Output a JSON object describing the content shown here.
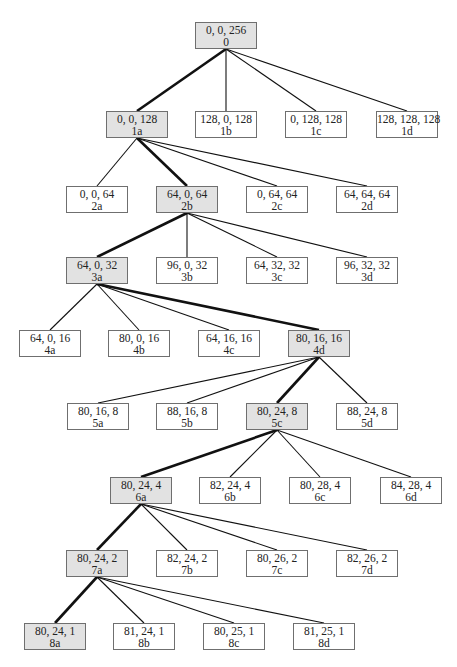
{
  "diagram": {
    "type": "search-tree",
    "colors": {
      "highlight_fill": "#e2e2e2",
      "node_fill": "#ffffff",
      "border": "#6f6f6f",
      "edge": "#111111"
    },
    "nodes": [
      {
        "id": "0",
        "coords": "0, 0, 256",
        "label": "0",
        "x": 195,
        "y": 22,
        "hl": true,
        "parent": null
      },
      {
        "id": "1a",
        "coords": "0, 0, 128",
        "label": "1a",
        "x": 106,
        "y": 111,
        "hl": true,
        "parent": "0"
      },
      {
        "id": "1b",
        "coords": "128, 0, 128",
        "label": "1b",
        "x": 195,
        "y": 111,
        "hl": false,
        "parent": "0"
      },
      {
        "id": "1c",
        "coords": "0, 128, 128",
        "label": "1c",
        "x": 285,
        "y": 111,
        "hl": false,
        "parent": "0"
      },
      {
        "id": "1d",
        "coords": "128, 128, 128",
        "label": "1d",
        "x": 376,
        "y": 111,
        "hl": false,
        "parent": "0"
      },
      {
        "id": "2a",
        "coords": "0, 0, 64",
        "label": "2a",
        "x": 66,
        "y": 186,
        "hl": false,
        "parent": "1a"
      },
      {
        "id": "2b",
        "coords": "64, 0, 64",
        "label": "2b",
        "x": 156,
        "y": 186,
        "hl": true,
        "parent": "1a"
      },
      {
        "id": "2c",
        "coords": "0, 64, 64",
        "label": "2c",
        "x": 246,
        "y": 186,
        "hl": false,
        "parent": "1a"
      },
      {
        "id": "2d",
        "coords": "64, 64, 64",
        "label": "2d",
        "x": 336,
        "y": 186,
        "hl": false,
        "parent": "1a"
      },
      {
        "id": "3a",
        "coords": "64, 0, 32",
        "label": "3a",
        "x": 66,
        "y": 257,
        "hl": true,
        "parent": "2b"
      },
      {
        "id": "3b",
        "coords": "96, 0, 32",
        "label": "3b",
        "x": 156,
        "y": 257,
        "hl": false,
        "parent": "2b"
      },
      {
        "id": "3c",
        "coords": "64, 32, 32",
        "label": "3c",
        "x": 246,
        "y": 257,
        "hl": false,
        "parent": "2b"
      },
      {
        "id": "3d",
        "coords": "96, 32, 32",
        "label": "3d",
        "x": 336,
        "y": 257,
        "hl": false,
        "parent": "2b"
      },
      {
        "id": "4a",
        "coords": "64, 0, 16",
        "label": "4a",
        "x": 19,
        "y": 330,
        "hl": false,
        "parent": "3a"
      },
      {
        "id": "4b",
        "coords": "80, 0, 16",
        "label": "4b",
        "x": 108,
        "y": 330,
        "hl": false,
        "parent": "3a"
      },
      {
        "id": "4c",
        "coords": "64, 16, 16",
        "label": "4c",
        "x": 198,
        "y": 330,
        "hl": false,
        "parent": "3a"
      },
      {
        "id": "4d",
        "coords": "80, 16, 16",
        "label": "4d",
        "x": 288,
        "y": 330,
        "hl": true,
        "parent": "3a"
      },
      {
        "id": "5a",
        "coords": "80, 16, 8",
        "label": "5a",
        "x": 67,
        "y": 403,
        "hl": false,
        "parent": "4d"
      },
      {
        "id": "5b",
        "coords": "88, 16, 8",
        "label": "5b",
        "x": 156,
        "y": 403,
        "hl": false,
        "parent": "4d"
      },
      {
        "id": "5c",
        "coords": "80, 24, 8",
        "label": "5c",
        "x": 246,
        "y": 403,
        "hl": true,
        "parent": "4d"
      },
      {
        "id": "5d",
        "coords": "88, 24, 8",
        "label": "5d",
        "x": 336,
        "y": 403,
        "hl": false,
        "parent": "4d"
      },
      {
        "id": "6a",
        "coords": "80, 24, 4",
        "label": "6a",
        "x": 110,
        "y": 477,
        "hl": true,
        "parent": "5c"
      },
      {
        "id": "6b",
        "coords": "82, 24, 4",
        "label": "6b",
        "x": 199,
        "y": 477,
        "hl": false,
        "parent": "5c"
      },
      {
        "id": "6c",
        "coords": "80, 28, 4",
        "label": "6c",
        "x": 289,
        "y": 477,
        "hl": false,
        "parent": "5c"
      },
      {
        "id": "6d",
        "coords": "84, 28, 4",
        "label": "6d",
        "x": 380,
        "y": 477,
        "hl": false,
        "parent": "5c"
      },
      {
        "id": "7a",
        "coords": "80, 24, 2",
        "label": "7a",
        "x": 66,
        "y": 550,
        "hl": true,
        "parent": "6a"
      },
      {
        "id": "7b",
        "coords": "82, 24, 2",
        "label": "7b",
        "x": 156,
        "y": 550,
        "hl": false,
        "parent": "6a"
      },
      {
        "id": "7c",
        "coords": "80, 26, 2",
        "label": "7c",
        "x": 246,
        "y": 550,
        "hl": false,
        "parent": "6a"
      },
      {
        "id": "7d",
        "coords": "82, 26, 2",
        "label": "7d",
        "x": 336,
        "y": 550,
        "hl": false,
        "parent": "6a"
      },
      {
        "id": "8a",
        "coords": "80, 24, 1",
        "label": "8a",
        "x": 24,
        "y": 623,
        "hl": true,
        "parent": "7a"
      },
      {
        "id": "8b",
        "coords": "81, 24, 1",
        "label": "8b",
        "x": 113,
        "y": 623,
        "hl": false,
        "parent": "7a"
      },
      {
        "id": "8c",
        "coords": "80, 25, 1",
        "label": "8c",
        "x": 203,
        "y": 623,
        "hl": false,
        "parent": "7a"
      },
      {
        "id": "8d",
        "coords": "81, 25, 1",
        "label": "8d",
        "x": 293,
        "y": 623,
        "hl": false,
        "parent": "7a"
      }
    ]
  }
}
